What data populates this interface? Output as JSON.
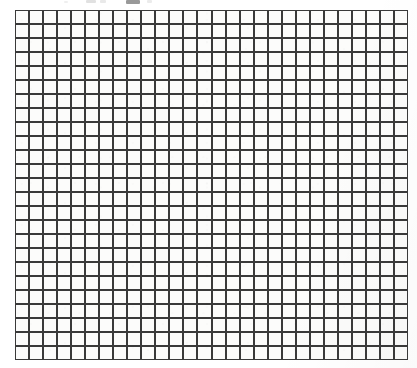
{
  "page": {
    "width": 417,
    "height": 368,
    "background_color": "#ffffff"
  },
  "clipped_text": {
    "present": true,
    "readable": false,
    "note": "Faint descender remnants of a caption cropped off the top edge of the scan; no legible characters."
  },
  "grid": {
    "name": "graph-paper-grid",
    "columns": 28,
    "rows": 25,
    "cell_width": 14.05,
    "cell_height": 14.0,
    "left": 15,
    "top": 10,
    "width": 393,
    "height": 350,
    "line_color": "#3a3a3a",
    "line_width": 1.1,
    "cell_fill": "#fcfcfb",
    "outer_border_color": "#3a3a3a",
    "outer_border_width": 1.1,
    "uniform_line_weight": true
  }
}
